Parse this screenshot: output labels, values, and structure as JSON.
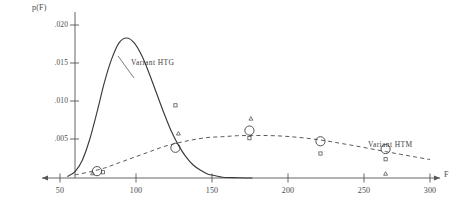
{
  "chart_data": {
    "type": "line",
    "title": "",
    "xlabel": "F",
    "ylabel": "p(F)",
    "xlim": [
      40,
      305
    ],
    "ylim": [
      0,
      0.0215
    ],
    "grid": false,
    "legend": "inline-annotations",
    "x_ticks": [
      50,
      100,
      150,
      200,
      250,
      300
    ],
    "x_tick_labels": [
      "50",
      "100",
      "150",
      "200",
      "250",
      "300"
    ],
    "y_ticks": [
      0.005,
      0.01,
      0.015,
      0.02
    ],
    "y_tick_labels": [
      ".005",
      ".010",
      ".015",
      ".020"
    ],
    "series": [
      {
        "name": "Variant HTG",
        "style": "solid",
        "label": "Variant   HTG",
        "distribution": "normal",
        "mean": 95,
        "sigma": 21.5,
        "peak_value": 0.0183,
        "points": [
          {
            "x": 55,
            "y": 0.0002
          },
          {
            "x": 60,
            "y": 0.0008
          },
          {
            "x": 65,
            "y": 0.0023
          },
          {
            "x": 70,
            "y": 0.005
          },
          {
            "x": 75,
            "y": 0.0086
          },
          {
            "x": 80,
            "y": 0.0125
          },
          {
            "x": 85,
            "y": 0.0156
          },
          {
            "x": 90,
            "y": 0.0177
          },
          {
            "x": 95,
            "y": 0.0183
          },
          {
            "x": 100,
            "y": 0.0177
          },
          {
            "x": 105,
            "y": 0.0161
          },
          {
            "x": 110,
            "y": 0.0138
          },
          {
            "x": 115,
            "y": 0.0112
          },
          {
            "x": 120,
            "y": 0.0086
          },
          {
            "x": 125,
            "y": 0.0062
          },
          {
            "x": 130,
            "y": 0.0043
          },
          {
            "x": 135,
            "y": 0.0028
          },
          {
            "x": 140,
            "y": 0.0017
          },
          {
            "x": 145,
            "y": 0.001
          },
          {
            "x": 150,
            "y": 0.0005
          },
          {
            "x": 155,
            "y": 0.0003
          },
          {
            "x": 160,
            "y": 0.0001
          },
          {
            "x": 170,
            "y": 3e-05
          },
          {
            "x": 180,
            "y": 0.0
          }
        ]
      },
      {
        "name": "Variant HTM",
        "style": "dashed",
        "label": "Variant   HTM",
        "distribution": "normal",
        "mean": 190,
        "sigma": 72,
        "peak_value": 0.00555,
        "points": [
          {
            "x": 60,
            "y": 0.0004
          },
          {
            "x": 70,
            "y": 0.0008
          },
          {
            "x": 80,
            "y": 0.0013
          },
          {
            "x": 90,
            "y": 0.002
          },
          {
            "x": 100,
            "y": 0.0027
          },
          {
            "x": 110,
            "y": 0.0034
          },
          {
            "x": 120,
            "y": 0.0041
          },
          {
            "x": 130,
            "y": 0.0046
          },
          {
            "x": 140,
            "y": 0.005
          },
          {
            "x": 150,
            "y": 0.0053
          },
          {
            "x": 160,
            "y": 0.0054
          },
          {
            "x": 170,
            "y": 0.00553
          },
          {
            "x": 180,
            "y": 0.00555
          },
          {
            "x": 190,
            "y": 0.00555
          },
          {
            "x": 200,
            "y": 0.00548
          },
          {
            "x": 210,
            "y": 0.00533
          },
          {
            "x": 220,
            "y": 0.00512
          },
          {
            "x": 230,
            "y": 0.00485
          },
          {
            "x": 240,
            "y": 0.00452
          },
          {
            "x": 250,
            "y": 0.00418
          },
          {
            "x": 260,
            "y": 0.00382
          },
          {
            "x": 270,
            "y": 0.00345
          },
          {
            "x": 280,
            "y": 0.0031
          },
          {
            "x": 290,
            "y": 0.00275
          },
          {
            "x": 300,
            "y": 0.00242
          }
        ]
      }
    ],
    "markers": [
      {
        "shape": "circle",
        "size": "large",
        "x": 75,
        "y": 0.0009
      },
      {
        "shape": "square",
        "size": "small",
        "x": 79,
        "y": 0.00075
      },
      {
        "shape": "triangle",
        "size": "small",
        "x": 72,
        "y": 0.0006
      },
      {
        "shape": "circle",
        "size": "large",
        "x": 128,
        "y": 0.00395
      },
      {
        "shape": "square",
        "size": "small",
        "x": 128,
        "y": 0.0095
      },
      {
        "shape": "triangle",
        "size": "small",
        "x": 130,
        "y": 0.0058
      },
      {
        "shape": "circle",
        "size": "large",
        "x": 178,
        "y": 0.0062
      },
      {
        "shape": "square",
        "size": "small",
        "x": 178,
        "y": 0.0052
      },
      {
        "shape": "triangle",
        "size": "small",
        "x": 179,
        "y": 0.00775
      },
      {
        "shape": "circle",
        "size": "large",
        "x": 226,
        "y": 0.0048
      },
      {
        "shape": "square",
        "size": "small",
        "x": 226,
        "y": 0.0032
      },
      {
        "shape": "circle",
        "size": "large",
        "x": 270,
        "y": 0.00378
      },
      {
        "shape": "square",
        "size": "small",
        "x": 270,
        "y": 0.00245
      },
      {
        "shape": "triangle",
        "size": "small",
        "x": 270,
        "y": 0.00055
      }
    ],
    "annotations": [
      {
        "text": "Variant   HTG",
        "x": 128,
        "y": 0.0131,
        "leader": true
      },
      {
        "text": "Variant   HTM",
        "x": 268,
        "y": 0.00545,
        "leader": false
      }
    ],
    "colors": {
      "curve_htg": "#3a3a3a",
      "curve_htm": "#5a5a5a",
      "axis": "#555555",
      "text": "#4a4a4a",
      "background": "#ffffff"
    }
  }
}
